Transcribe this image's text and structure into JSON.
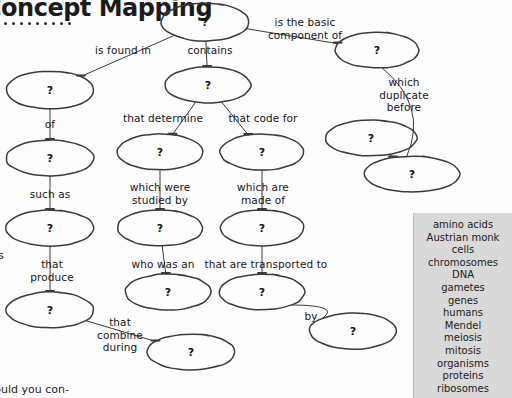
{
  "header": {
    "title": "Concept Mapping",
    "dot_count": 9
  },
  "footer": {
    "text": "Would you con-"
  },
  "side_fragment": {
    "text": "s"
  },
  "node_placeholder": "?",
  "nodes": [
    {
      "id": "n1",
      "cx": 205,
      "cy": 22,
      "rx": 44,
      "ry": 19,
      "label": "?"
    },
    {
      "id": "n2",
      "cx": 50,
      "cy": 90,
      "rx": 44,
      "ry": 19,
      "label": "?"
    },
    {
      "id": "n3",
      "cx": 208,
      "cy": 85,
      "rx": 43,
      "ry": 18,
      "label": "?"
    },
    {
      "id": "n4",
      "cx": 377,
      "cy": 50,
      "rx": 42,
      "ry": 18,
      "label": "?"
    },
    {
      "id": "n5",
      "cx": 50,
      "cy": 158,
      "rx": 44,
      "ry": 18,
      "label": "?"
    },
    {
      "id": "n6",
      "cx": 160,
      "cy": 152,
      "rx": 43,
      "ry": 18,
      "label": "?"
    },
    {
      "id": "n7",
      "cx": 262,
      "cy": 152,
      "rx": 42,
      "ry": 18,
      "label": "?"
    },
    {
      "id": "n8",
      "cx": 371,
      "cy": 138,
      "rx": 46,
      "ry": 18,
      "label": "?"
    },
    {
      "id": "n9",
      "cx": 412,
      "cy": 174,
      "rx": 48,
      "ry": 18,
      "label": "?"
    },
    {
      "id": "n10",
      "cx": 50,
      "cy": 228,
      "rx": 44,
      "ry": 18,
      "label": "?"
    },
    {
      "id": "n11",
      "cx": 160,
      "cy": 228,
      "rx": 43,
      "ry": 18,
      "label": "?"
    },
    {
      "id": "n12",
      "cx": 262,
      "cy": 228,
      "rx": 42,
      "ry": 18,
      "label": "?"
    },
    {
      "id": "n13",
      "cx": 50,
      "cy": 310,
      "rx": 44,
      "ry": 18,
      "label": "?"
    },
    {
      "id": "n14",
      "cx": 168,
      "cy": 292,
      "rx": 43,
      "ry": 18,
      "label": "?"
    },
    {
      "id": "n15",
      "cx": 262,
      "cy": 292,
      "rx": 43,
      "ry": 18,
      "label": "?"
    },
    {
      "id": "n16",
      "cx": 191,
      "cy": 352,
      "rx": 44,
      "ry": 18,
      "label": "?"
    },
    {
      "id": "n17",
      "cx": 353,
      "cy": 331,
      "rx": 44,
      "ry": 18,
      "label": "?"
    }
  ],
  "connector_labels": [
    {
      "id": "l1",
      "text": "is found in",
      "x": 123,
      "y": 44,
      "align": "center"
    },
    {
      "id": "l2",
      "text": "contains",
      "x": 210,
      "y": 44,
      "align": "center"
    },
    {
      "id": "l3",
      "text": "is the basic\ncomponent of",
      "x": 305,
      "y": 16,
      "align": "center"
    },
    {
      "id": "l4",
      "text": "which\nduplicate\nbefore",
      "x": 404,
      "y": 76,
      "align": "center"
    },
    {
      "id": "l5",
      "text": "of",
      "x": 50,
      "y": 118,
      "align": "center"
    },
    {
      "id": "l6",
      "text": "that determine",
      "x": 163,
      "y": 112,
      "align": "center"
    },
    {
      "id": "l7",
      "text": "that code for",
      "x": 263,
      "y": 112,
      "align": "center"
    },
    {
      "id": "l8",
      "text": "such as",
      "x": 50,
      "y": 188,
      "align": "center"
    },
    {
      "id": "l9",
      "text": "which were\nstudied by",
      "x": 160,
      "y": 181,
      "align": "center"
    },
    {
      "id": "l10",
      "text": "which are\nmade of",
      "x": 263,
      "y": 181,
      "align": "center"
    },
    {
      "id": "l11",
      "text": "that\nproduce",
      "x": 52,
      "y": 258,
      "align": "center"
    },
    {
      "id": "l12",
      "text": "who was an",
      "x": 163,
      "y": 258,
      "align": "center"
    },
    {
      "id": "l13",
      "text": "that are transported to",
      "x": 266,
      "y": 258,
      "align": "center"
    },
    {
      "id": "l14",
      "text": "that\ncombine\nduring",
      "x": 120,
      "y": 316,
      "align": "center"
    },
    {
      "id": "l15",
      "text": "by",
      "x": 311,
      "y": 310,
      "align": "center"
    }
  ],
  "edges": [
    {
      "id": "e1",
      "from": "n1",
      "to": "n2",
      "kind": "diagonal"
    },
    {
      "id": "e2",
      "from": "n1",
      "to": "n3",
      "kind": "vertical"
    },
    {
      "id": "e3",
      "from": "n1",
      "to": "n4",
      "kind": "diagonal"
    },
    {
      "id": "e4",
      "from": "n2",
      "to": "n5",
      "kind": "vertical"
    },
    {
      "id": "e5",
      "from": "n3",
      "to": "n6",
      "kind": "diagonal"
    },
    {
      "id": "e6",
      "from": "n3",
      "to": "n7",
      "kind": "diagonal"
    },
    {
      "id": "e7",
      "from": "n4",
      "to": "n9",
      "kind": "curve"
    },
    {
      "id": "e8",
      "from": "n5",
      "to": "n10",
      "kind": "vertical"
    },
    {
      "id": "e9",
      "from": "n6",
      "to": "n11",
      "kind": "vertical"
    },
    {
      "id": "e10",
      "from": "n7",
      "to": "n12",
      "kind": "vertical"
    },
    {
      "id": "e11",
      "from": "n8",
      "to": "n9",
      "kind": "diagonal"
    },
    {
      "id": "e12",
      "from": "n10",
      "to": "n13",
      "kind": "vertical"
    },
    {
      "id": "e13",
      "from": "n11",
      "to": "n14",
      "kind": "vertical"
    },
    {
      "id": "e14",
      "from": "n12",
      "to": "n15",
      "kind": "vertical"
    },
    {
      "id": "e15",
      "from": "n13",
      "to": "n16",
      "kind": "diagonal"
    },
    {
      "id": "e16",
      "from": "n15",
      "to": "n17",
      "kind": "curve"
    }
  ],
  "word_bank": {
    "background_color": "#d9d9d9",
    "items": [
      "amino acids",
      "Austrian monk",
      "cells",
      "chromosomes",
      "DNA",
      "gametes",
      "genes",
      "humans",
      "Mendel",
      "meiosis",
      "mitosis",
      "organisms",
      "proteins",
      "ribosomes"
    ]
  },
  "colors": {
    "ink": "#3a3a3a",
    "text": "#1b1b1b",
    "paper": "#fdfdfd"
  }
}
